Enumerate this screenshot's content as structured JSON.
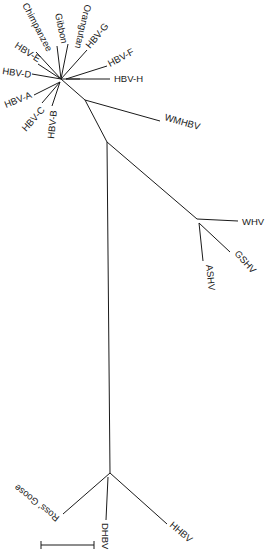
{
  "diagram": {
    "type": "unrooted-phylogenetic-tree",
    "ink_color": "#1a1a1a",
    "background": "#ffffff",
    "taxa": {
      "chimpanzee": "Chimpanzee",
      "gibbon": "Gibbon",
      "orangutan": "Orangutan",
      "hbv_g": "HBV-G",
      "hbv_f": "HBV-F",
      "hbv_h": "HBV-H",
      "hbv_e": "HBV-E",
      "hbv_d": "HBV-D",
      "hbv_a": "HBV-A",
      "hbv_c": "HBV-C",
      "hbv_b": "HBV-B",
      "wmhbv": "WMHBV",
      "whv": "WHV",
      "gshv": "GSHV",
      "ashv": "ASHV",
      "ross_goose": "Ross' Goose",
      "dhbv": "DHBV",
      "hhbv": "HHBV"
    },
    "scale_bar": {
      "label": ""
    }
  }
}
